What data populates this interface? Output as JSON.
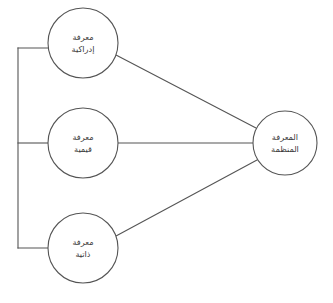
{
  "diagram": {
    "background_color": "#ffffff",
    "stroke_color": "#555555",
    "text_color": "#3a3a3a",
    "nodes": [
      {
        "id": "cognitive-knowledge",
        "name": "node-cognitive-knowledge",
        "line1": "معرفة",
        "line2": "إدراكية",
        "cx": 83,
        "cy": 43,
        "r": 35
      },
      {
        "id": "value-knowledge",
        "name": "node-value-knowledge",
        "line1": "معرفة",
        "line2": "قيمية",
        "cx": 83,
        "cy": 143,
        "r": 35
      },
      {
        "id": "self-knowledge",
        "name": "node-self-knowledge",
        "line1": "معرفة",
        "line2": "ذاتية",
        "cx": 83,
        "cy": 248,
        "r": 35
      },
      {
        "id": "organized-knowledge",
        "name": "node-organized-knowledge",
        "line1": "المعرفة",
        "line2": "المنظمة",
        "cx": 285,
        "cy": 143,
        "r": 32
      }
    ],
    "bracket": {
      "name": "left-bracket",
      "x": 18,
      "y_top": 48,
      "y_bottom": 248,
      "stubs": [
        {
          "name": "bracket-stub-cognitive",
          "y": 48,
          "x_end": 49
        },
        {
          "name": "bracket-stub-value",
          "y": 143,
          "x_end": 48
        },
        {
          "name": "bracket-stub-self",
          "y": 248,
          "x_end": 49
        }
      ]
    },
    "connectors": [
      {
        "name": "connector-cognitive-to-organized",
        "from": "cognitive-knowledge",
        "to": "organized-knowledge",
        "x1": 116,
        "y1": 55,
        "x2": 256,
        "y2": 128
      },
      {
        "name": "connector-value-to-organized",
        "from": "value-knowledge",
        "to": "organized-knowledge",
        "x1": 118,
        "y1": 143,
        "x2": 253,
        "y2": 143
      },
      {
        "name": "connector-self-to-organized",
        "from": "self-knowledge",
        "to": "organized-knowledge",
        "x1": 116,
        "y1": 236,
        "x2": 257,
        "y2": 160
      }
    ]
  }
}
